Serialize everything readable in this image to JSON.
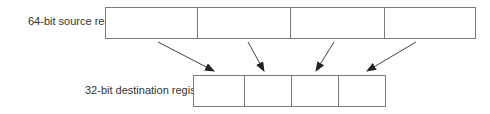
{
  "source": {
    "label": "64-bit source register",
    "cells": 4
  },
  "destination": {
    "label": "32-bit destination register",
    "cells": 4
  },
  "colors": {
    "stroke": "#7a7a7a",
    "arrow": "#333333",
    "text": "#333333"
  }
}
